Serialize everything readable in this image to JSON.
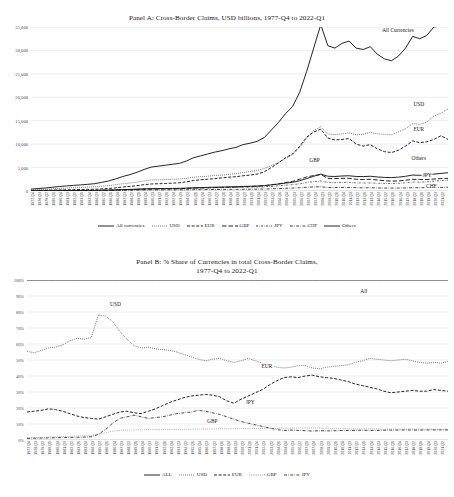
{
  "panelA": {
    "title": "Panel A: Cross-Border Claims, USD billions, 1977-Q4 to 2022-Q1",
    "annotations": {
      "all": "All Currencies",
      "usd": "USD",
      "eur": "EUR",
      "others": "Others",
      "jpy": "JPY",
      "chf": "CHF",
      "gbp": "GBP"
    },
    "legend": [
      {
        "label": "All currencies",
        "style": "solid"
      },
      {
        "label": "USD",
        "style": "dotted"
      },
      {
        "label": "EUR",
        "style": "dashdash"
      },
      {
        "label": "GBP",
        "style": "longdash"
      },
      {
        "label": "JPY",
        "style": "dashdot-fine"
      },
      {
        "label": "CHF",
        "style": "dashdot"
      },
      {
        "label": "Others",
        "style": "solid"
      }
    ]
  },
  "panelB": {
    "title_line1": "Panel B: % Share of Currencies in total Cross-Border Claims,",
    "title_line2": "1977-Q4 to 2022-Q1",
    "annotations": {
      "all": "All",
      "usd": "USD",
      "eur": "EUR",
      "jpy": "JPY",
      "gbp": "GBP"
    },
    "legend": [
      {
        "label": "ALL",
        "style": "solid"
      },
      {
        "label": "USD",
        "style": "dotted"
      },
      {
        "label": "EUR",
        "style": "dashdash"
      },
      {
        "label": "GBP",
        "style": "finedot"
      },
      {
        "label": "JPY",
        "style": "dashdot"
      }
    ]
  },
  "xticks": [
    "1977-Q4",
    "1978-Q3",
    "1979-Q2",
    "1980-Q1",
    "1980-Q4",
    "1981-Q3",
    "1982-Q2",
    "1983-Q1",
    "1983-Q4",
    "1984-Q3",
    "1985-Q2",
    "1986-Q1",
    "1986-Q4",
    "1987-Q3",
    "1988-Q2",
    "1989-Q1",
    "1989-Q4",
    "1990-Q3",
    "1991-Q2",
    "1992-Q1",
    "1992-Q4",
    "1993-Q3",
    "1994-Q2",
    "1995-Q1",
    "1995-Q4",
    "1996-Q3",
    "1997-Q2",
    "1998-Q1",
    "1998-Q4",
    "1999-Q3",
    "2000-Q2",
    "2001-Q1",
    "2001-Q4",
    "2002-Q3",
    "2003-Q2",
    "2004-Q1",
    "2004-Q4",
    "2005-Q3",
    "2006-Q2",
    "2007-Q1",
    "2007-Q4",
    "2008-Q3",
    "2009-Q2",
    "2010-Q1",
    "2010-Q4",
    "2011-Q3",
    "2012-Q2",
    "2013-Q1",
    "2013-Q4",
    "2014-Q3",
    "2015-Q2",
    "2016-Q1",
    "2016-Q4",
    "2017-Q3",
    "2018-Q2",
    "2019-Q1",
    "2019-Q4",
    "2020-Q3",
    "2021-Q2",
    "2022-Q1"
  ],
  "chart_data": [
    {
      "type": "line",
      "title": "Panel A: Cross-Border Claims, USD billions, 1977-Q4 to 2022-Q1",
      "xlabel": "",
      "ylabel": "USD billions",
      "ylim": [
        0,
        35000
      ],
      "yticks": [
        0,
        5000,
        10000,
        15000,
        20000,
        25000,
        30000,
        35000
      ],
      "ytick_labels": [
        "0",
        "5,000",
        "10,000",
        "15,000",
        "20,000",
        "25,000",
        "30,000",
        "35,000"
      ],
      "grid": true,
      "legend_position": "bottom",
      "x": [
        "1977-Q4",
        "1978-Q3",
        "1979-Q2",
        "1980-Q1",
        "1980-Q4",
        "1981-Q3",
        "1982-Q2",
        "1983-Q1",
        "1983-Q4",
        "1984-Q3",
        "1985-Q2",
        "1986-Q1",
        "1986-Q4",
        "1987-Q3",
        "1988-Q2",
        "1989-Q1",
        "1989-Q4",
        "1990-Q3",
        "1991-Q2",
        "1992-Q1",
        "1992-Q4",
        "1993-Q3",
        "1994-Q2",
        "1995-Q1",
        "1995-Q4",
        "1996-Q3",
        "1997-Q2",
        "1998-Q1",
        "1998-Q4",
        "1999-Q3",
        "2000-Q2",
        "2001-Q1",
        "2001-Q4",
        "2002-Q3",
        "2003-Q2",
        "2004-Q1",
        "2004-Q4",
        "2005-Q3",
        "2006-Q2",
        "2007-Q1",
        "2007-Q4",
        "2008-Q3",
        "2009-Q2",
        "2010-Q1",
        "2010-Q4",
        "2011-Q3",
        "2012-Q2",
        "2013-Q1",
        "2013-Q4",
        "2014-Q3",
        "2015-Q2",
        "2016-Q1",
        "2016-Q4",
        "2017-Q3",
        "2018-Q2",
        "2019-Q1",
        "2019-Q4",
        "2020-Q3",
        "2021-Q2",
        "2022-Q1"
      ],
      "series": [
        {
          "name": "All currencies",
          "style": "solid",
          "values": [
            400,
            520,
            640,
            800,
            950,
            1080,
            1200,
            1300,
            1420,
            1560,
            1850,
            2150,
            2600,
            3100,
            3500,
            4000,
            4600,
            5100,
            5300,
            5500,
            5700,
            5900,
            6400,
            7100,
            7500,
            7900,
            8300,
            8600,
            9000,
            9300,
            9900,
            10200,
            10600,
            11400,
            13000,
            14600,
            16500,
            18000,
            21000,
            25500,
            30500,
            35500,
            31000,
            30500,
            31500,
            32000,
            30500,
            30200,
            30800,
            29200,
            28200,
            27800,
            28800,
            30500,
            33000,
            32500,
            33200,
            35000,
            35200,
            36000
          ]
        },
        {
          "name": "USD",
          "style": "dotted",
          "values": [
            230,
            300,
            360,
            450,
            540,
            620,
            700,
            760,
            830,
            900,
            1020,
            1150,
            1350,
            1550,
            1700,
            1900,
            2150,
            2350,
            2400,
            2450,
            2500,
            2550,
            2700,
            2950,
            3050,
            3150,
            3300,
            3400,
            3550,
            3700,
            3950,
            4150,
            4400,
            4800,
            5400,
            6000,
            6900,
            7700,
            9300,
            11200,
            12900,
            13700,
            12200,
            12000,
            12200,
            12400,
            12000,
            12100,
            12500,
            12200,
            12100,
            12000,
            12600,
            13300,
            14400,
            14200,
            14700,
            16000,
            16600,
            17500
          ]
        },
        {
          "name": "EUR",
          "style": "dashdash",
          "values": [
            90,
            120,
            150,
            190,
            230,
            260,
            290,
            320,
            350,
            380,
            450,
            540,
            680,
            850,
            980,
            1150,
            1350,
            1500,
            1550,
            1600,
            1680,
            1750,
            1950,
            2250,
            2400,
            2500,
            2650,
            2800,
            2950,
            3050,
            3250,
            3400,
            3600,
            4100,
            5000,
            6000,
            7100,
            7900,
            9500,
            11500,
            12600,
            13200,
            11300,
            10900,
            11000,
            11200,
            10000,
            9600,
            9900,
            9000,
            8400,
            8200,
            8700,
            9600,
            10700,
            10300,
            10500,
            11000,
            11800,
            11000
          ]
        },
        {
          "name": "GBP",
          "style": "longdash",
          "values": [
            30,
            40,
            50,
            62,
            75,
            85,
            95,
            105,
            115,
            125,
            145,
            170,
            210,
            250,
            290,
            330,
            380,
            420,
            440,
            460,
            480,
            500,
            550,
            610,
            650,
            690,
            730,
            770,
            810,
            850,
            910,
            960,
            1020,
            1130,
            1320,
            1520,
            1800,
            2050,
            2500,
            3000,
            3300,
            3500,
            2700,
            2650,
            2700,
            2700,
            2500,
            2450,
            2500,
            2350,
            2200,
            2100,
            2150,
            2300,
            2500,
            2450,
            2450,
            2550,
            2650,
            2700
          ]
        },
        {
          "name": "JPY",
          "style": "dashdot-fine",
          "values": [
            25,
            32,
            40,
            50,
            60,
            70,
            80,
            90,
            100,
            112,
            135,
            165,
            210,
            270,
            320,
            380,
            440,
            480,
            490,
            500,
            510,
            520,
            560,
            620,
            650,
            670,
            700,
            720,
            740,
            760,
            790,
            810,
            840,
            900,
            1000,
            1100,
            1250,
            1350,
            1550,
            1800,
            2000,
            2150,
            1800,
            1780,
            1820,
            1850,
            1750,
            1700,
            1720,
            1650,
            1600,
            1580,
            1650,
            1750,
            1900,
            1880,
            1950,
            2100,
            2200,
            2300
          ]
        },
        {
          "name": "CHF",
          "style": "dashdot",
          "values": [
            20,
            25,
            30,
            36,
            42,
            48,
            53,
            58,
            63,
            68,
            78,
            90,
            110,
            135,
            155,
            178,
            205,
            225,
            230,
            235,
            240,
            245,
            265,
            290,
            300,
            310,
            325,
            335,
            345,
            355,
            370,
            380,
            395,
            420,
            465,
            510,
            570,
            620,
            700,
            800,
            870,
            900,
            760,
            740,
            750,
            760,
            700,
            680,
            690,
            650,
            620,
            610,
            630,
            660,
            710,
            700,
            710,
            750,
            780,
            800
          ]
        },
        {
          "name": "Others",
          "style": "solid",
          "values": [
            35,
            45,
            56,
            70,
            84,
            96,
            108,
            118,
            130,
            142,
            168,
            200,
            245,
            295,
            340,
            390,
            450,
            500,
            515,
            530,
            548,
            566,
            620,
            690,
            730,
            770,
            810,
            845,
            885,
            918,
            975,
            1010,
            1055,
            1140,
            1310,
            1480,
            1690,
            1850,
            2180,
            2650,
            3150,
            3600,
            3150,
            3100,
            3200,
            3250,
            3100,
            3080,
            3150,
            3000,
            2900,
            2860,
            2960,
            3140,
            3400,
            3350,
            3420,
            3600,
            3750,
            3900
          ]
        }
      ]
    },
    {
      "type": "line",
      "title": "Panel B: % Share of Currencies in total Cross-Border Claims, 1977-Q4 to 2022-Q1",
      "xlabel": "",
      "ylabel": "% share",
      "ylim": [
        0,
        100
      ],
      "yticks": [
        0,
        10,
        20,
        30,
        40,
        50,
        60,
        70,
        80,
        90,
        100
      ],
      "ytick_labels": [
        "0%",
        "10%",
        "20%",
        "30%",
        "40%",
        "50%",
        "60%",
        "70%",
        "80%",
        "90%",
        "100%"
      ],
      "grid": true,
      "legend_position": "bottom",
      "x": [
        "1977-Q4",
        "1978-Q3",
        "1979-Q2",
        "1980-Q1",
        "1980-Q4",
        "1981-Q3",
        "1982-Q2",
        "1983-Q1",
        "1983-Q4",
        "1984-Q3",
        "1985-Q2",
        "1986-Q1",
        "1986-Q4",
        "1987-Q3",
        "1988-Q2",
        "1989-Q1",
        "1989-Q4",
        "1990-Q3",
        "1991-Q2",
        "1992-Q1",
        "1992-Q4",
        "1993-Q3",
        "1994-Q2",
        "1995-Q1",
        "1995-Q4",
        "1996-Q3",
        "1997-Q2",
        "1998-Q1",
        "1998-Q4",
        "1999-Q3",
        "2000-Q2",
        "2001-Q1",
        "2001-Q4",
        "2002-Q3",
        "2003-Q2",
        "2004-Q1",
        "2004-Q4",
        "2005-Q3",
        "2006-Q2",
        "2007-Q1",
        "2007-Q4",
        "2008-Q3",
        "2009-Q2",
        "2010-Q1",
        "2010-Q4",
        "2011-Q3",
        "2012-Q2",
        "2013-Q1",
        "2013-Q4",
        "2014-Q3",
        "2015-Q2",
        "2016-Q1",
        "2016-Q4",
        "2017-Q3",
        "2018-Q2",
        "2019-Q1",
        "2019-Q4",
        "2020-Q3",
        "2021-Q2",
        "2022-Q1"
      ],
      "series": [
        {
          "name": "ALL",
          "style": "solid",
          "values": [
            100,
            100,
            100,
            100,
            100,
            100,
            100,
            100,
            100,
            100,
            100,
            100,
            100,
            100,
            100,
            100,
            100,
            100,
            100,
            100,
            100,
            100,
            100,
            100,
            100,
            100,
            100,
            100,
            100,
            100,
            100,
            100,
            100,
            100,
            100,
            100,
            100,
            100,
            100,
            100,
            100,
            100,
            100,
            100,
            100,
            100,
            100,
            100,
            100,
            100,
            100,
            100,
            100,
            100,
            100,
            100,
            100,
            100,
            100,
            100
          ]
        },
        {
          "name": "USD",
          "style": "dotted",
          "values": [
            55.5,
            54.5,
            56.0,
            57.5,
            58.0,
            59.5,
            62.0,
            63.5,
            63.0,
            64.0,
            78.0,
            77.5,
            74.0,
            68.0,
            63.0,
            59.0,
            57.5,
            58.0,
            57.0,
            56.5,
            56.0,
            55.0,
            53.5,
            52.0,
            50.5,
            49.5,
            50.5,
            51.0,
            49.5,
            48.5,
            49.5,
            51.0,
            49.5,
            48.0,
            46.5,
            45.5,
            45.0,
            45.5,
            46.5,
            46.5,
            45.0,
            44.5,
            45.5,
            46.0,
            46.5,
            47.0,
            48.5,
            49.5,
            51.0,
            50.5,
            50.0,
            49.5,
            50.0,
            50.5,
            49.5,
            48.5,
            48.0,
            48.5,
            48.0,
            49.0
          ]
        },
        {
          "name": "EUR",
          "style": "dashdash",
          "values": [
            17.5,
            18.0,
            18.5,
            19.5,
            19.0,
            18.0,
            16.5,
            15.0,
            14.0,
            13.5,
            13.0,
            14.5,
            16.0,
            17.5,
            18.0,
            17.0,
            16.5,
            18.0,
            19.5,
            21.5,
            23.5,
            25.0,
            26.5,
            27.5,
            28.0,
            28.5,
            28.0,
            27.0,
            24.5,
            23.0,
            25.5,
            27.5,
            29.5,
            31.5,
            34.5,
            37.0,
            39.0,
            39.5,
            39.0,
            40.0,
            40.5,
            39.5,
            39.0,
            38.5,
            37.5,
            36.5,
            35.0,
            34.0,
            33.0,
            32.0,
            30.5,
            29.5,
            30.0,
            30.5,
            31.0,
            30.5,
            30.5,
            31.5,
            31.0,
            30.5
          ]
        },
        {
          "name": "GBP",
          "style": "finedot",
          "values": [
            1.5,
            1.5,
            1.6,
            1.8,
            2.0,
            2.2,
            2.4,
            2.5,
            2.6,
            2.8,
            3.5,
            4.5,
            5.5,
            6.0,
            6.2,
            6.3,
            6.4,
            6.5,
            6.5,
            6.5,
            6.6,
            6.6,
            6.7,
            6.8,
            6.8,
            6.9,
            6.9,
            7.0,
            7.0,
            7.0,
            7.1,
            7.1,
            7.2,
            7.2,
            7.3,
            7.3,
            7.4,
            7.4,
            7.5,
            7.5,
            7.5,
            7.5,
            7.3,
            7.2,
            7.2,
            7.1,
            7.0,
            7.0,
            7.0,
            6.9,
            6.8,
            6.8,
            6.8,
            6.9,
            6.9,
            6.8,
            6.8,
            6.8,
            6.8,
            6.8
          ]
        },
        {
          "name": "JPY",
          "style": "dashdot",
          "values": [
            1.0,
            1.1,
            1.2,
            1.3,
            1.4,
            1.5,
            1.6,
            1.7,
            1.8,
            2.0,
            3.5,
            6.5,
            10.5,
            13.5,
            14.5,
            15.5,
            14.5,
            13.5,
            14.0,
            14.5,
            15.5,
            16.5,
            17.0,
            17.5,
            18.5,
            18.0,
            17.0,
            16.0,
            14.5,
            13.0,
            11.5,
            10.5,
            9.5,
            8.5,
            7.5,
            6.5,
            6.0,
            6.2,
            6.0,
            5.8,
            5.6,
            5.8,
            5.7,
            5.8,
            5.9,
            6.0,
            6.0,
            6.1,
            6.0,
            6.0,
            6.1,
            6.2,
            6.2,
            6.3,
            6.2,
            6.2,
            6.3,
            6.3,
            6.3,
            6.3
          ]
        }
      ]
    }
  ]
}
